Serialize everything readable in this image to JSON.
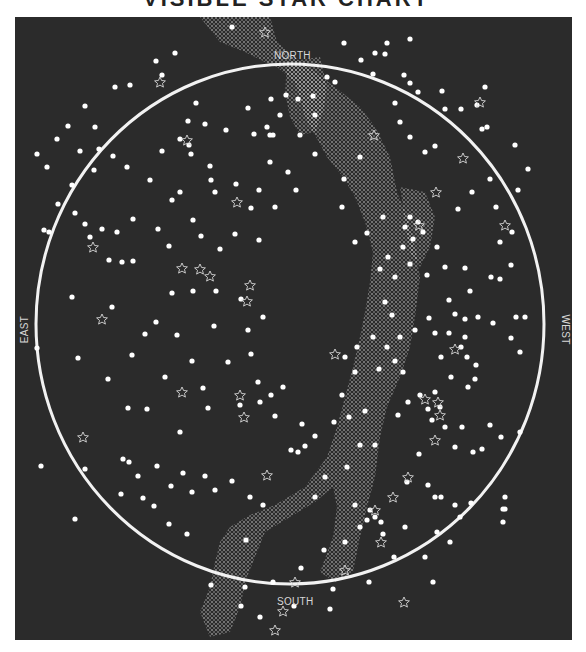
{
  "title": "VISIBLE STAR CHART",
  "map": {
    "labels": {
      "north": "NORTH",
      "south": "SOUTH",
      "east": "EAST",
      "west": "WEST"
    },
    "colors": {
      "background": "#2b2b2b",
      "horizon": "#f2f2f2",
      "star": "#ffffff",
      "milky_way": "#cfcfcf"
    },
    "horizon": {
      "cx": 275,
      "cy": 307,
      "rx": 254,
      "ry": 260
    },
    "legend_symbols": {
      "dot": "star",
      "outline_star": "deep-sky object"
    }
  }
}
